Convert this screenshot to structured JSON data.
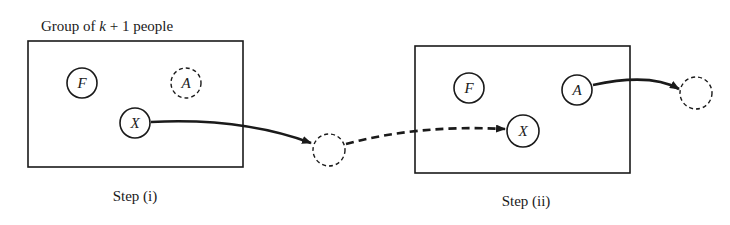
{
  "diagram": {
    "title": "Group of k + 1 people",
    "title_parts": {
      "prefix": "Group of ",
      "var": "k",
      "suffix": " + 1 people"
    },
    "steps": [
      {
        "label": "Step (i)",
        "nodes": [
          {
            "id": "F",
            "label": "F",
            "style": "solid"
          },
          {
            "id": "A",
            "label": "A",
            "style": "dashed"
          },
          {
            "id": "X",
            "label": "X",
            "style": "solid"
          }
        ],
        "edges": [
          {
            "from": "X",
            "to": "outside-empty",
            "style": "solid-arrow"
          }
        ]
      },
      {
        "label": "Step (ii)",
        "nodes": [
          {
            "id": "F",
            "label": "F",
            "style": "solid"
          },
          {
            "id": "A",
            "label": "A",
            "style": "solid"
          },
          {
            "id": "X",
            "label": "X",
            "style": "solid"
          }
        ],
        "edges": [
          {
            "from": "outside-empty",
            "to": "X",
            "style": "dashed-arrow"
          },
          {
            "from": "A",
            "to": "outside-empty-right",
            "style": "solid-arrow"
          }
        ]
      }
    ],
    "colors": {
      "ink": "#1a1a1a",
      "background": "#ffffff"
    }
  }
}
